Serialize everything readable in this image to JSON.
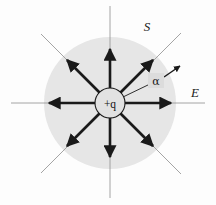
{
  "figure": {
    "background_color": "#fdfdfd",
    "surface": {
      "label": "S",
      "fill_color": "#e6e6e6",
      "center_x": 110,
      "center_y": 103,
      "radius": 66,
      "label_x": 147,
      "label_y": 28
    },
    "charge": {
      "label": "+q",
      "center_x": 110,
      "center_y": 103,
      "radius": 15,
      "fill_color": "#e2e2e2",
      "stroke_color": "#1a1a1a"
    },
    "field_label": {
      "text": "E",
      "x": 195,
      "y": 94
    },
    "angle_label": {
      "text": "α",
      "x": 155,
      "y": 83,
      "box_fill": "#dcdcdc"
    },
    "axis_color": "#8a8a8a",
    "ray_color": "#1a1a1a",
    "rays": [
      {
        "name": "ray-east",
        "angle_deg": 0,
        "thin_end": 205,
        "arrow_end": 62,
        "has_arrow": true
      },
      {
        "name": "ray-northeast",
        "angle_deg": 45,
        "thin_end": 104,
        "arrow_end": 66,
        "has_arrow": true
      },
      {
        "name": "ray-north",
        "angle_deg": 90,
        "thin_end": 103,
        "arrow_end": 55,
        "has_arrow": true
      },
      {
        "name": "ray-northwest",
        "angle_deg": 135,
        "thin_end": 100,
        "arrow_end": 66,
        "has_arrow": true
      },
      {
        "name": "ray-west",
        "angle_deg": 180,
        "thin_end": 98,
        "arrow_end": 62,
        "has_arrow": true
      },
      {
        "name": "ray-southwest",
        "angle_deg": 225,
        "thin_end": 100,
        "arrow_end": 66,
        "has_arrow": true
      },
      {
        "name": "ray-south",
        "angle_deg": 270,
        "thin_end": 94,
        "arrow_end": 55,
        "has_arrow": true
      },
      {
        "name": "ray-southeast",
        "angle_deg": 315,
        "thin_end": 104,
        "arrow_end": 66,
        "has_arrow": true
      }
    ],
    "vector_arrow": {
      "name": "field-direction-arrow",
      "x1": 165,
      "y1": 76,
      "x2": 180,
      "y2": 66
    }
  }
}
